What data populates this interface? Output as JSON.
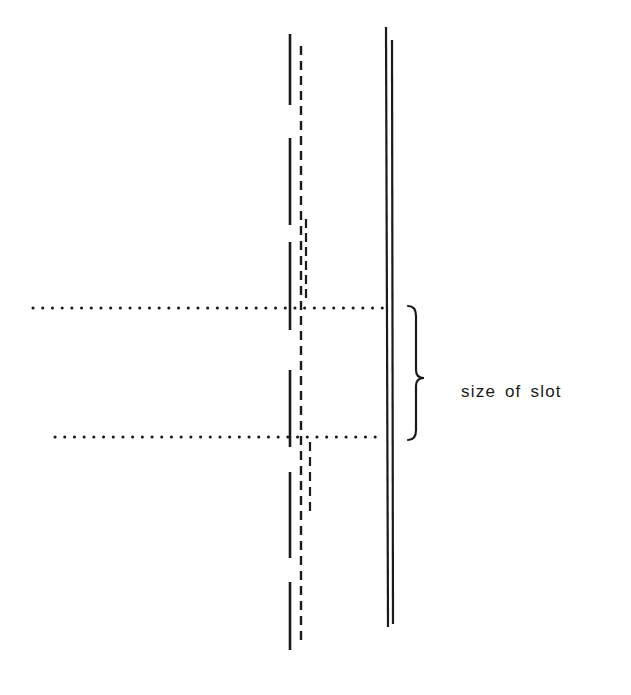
{
  "diagram": {
    "label": "size of slot",
    "ink_color": "#1a1a1a",
    "left_solid_line": {
      "x": 290,
      "segments": [
        [
          34,
          105
        ],
        [
          138,
          225
        ],
        [
          242,
          330
        ],
        [
          370,
          447
        ],
        [
          472,
          558
        ],
        [
          582,
          650
        ]
      ]
    },
    "left_dashed_line": {
      "x": 301,
      "y_start": 46,
      "y_end": 642,
      "dash": [
        9,
        6
      ]
    },
    "overlap_dashes_upper": {
      "x": 306,
      "y_start": 219,
      "y_end": 298,
      "dash": [
        9,
        5
      ]
    },
    "overlap_dashes_lower": {
      "x": 310,
      "y_start": 442,
      "y_end": 515,
      "dash": [
        9,
        6
      ]
    },
    "right_double_line": {
      "left": {
        "x": 386,
        "y_start": 27,
        "y_end": 627
      },
      "right": {
        "x": 392,
        "y_start": 40,
        "y_end": 624
      }
    },
    "dotted_lines": [
      {
        "x_start": 33,
        "x_end": 384,
        "y": 308
      },
      {
        "x_start": 55,
        "x_end": 384,
        "y": 437
      }
    ],
    "brace": {
      "x_left": 408,
      "x_right": 424,
      "y_top": 306,
      "y_mid": 378,
      "y_bottom": 440
    },
    "label_position": {
      "x": 461,
      "y": 382
    }
  }
}
